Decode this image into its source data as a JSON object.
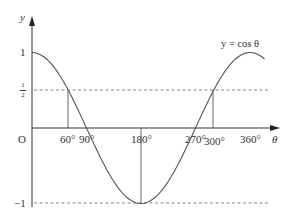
{
  "chart_data": {
    "type": "line",
    "title": "",
    "xlabel": "θ",
    "ylabel": "y",
    "curve_label": "y = cos θ",
    "function": "cos",
    "x_range_deg": [
      0,
      385
    ],
    "ylim": [
      -1,
      1
    ],
    "x_ticks": [
      {
        "value": 60,
        "label": "60°"
      },
      {
        "value": 90,
        "label": "90°"
      },
      {
        "value": 180,
        "label": "180°"
      },
      {
        "value": 270,
        "label": "270°"
      },
      {
        "value": 300,
        "label": "300°"
      },
      {
        "value": 360,
        "label": "360°"
      }
    ],
    "y_ticks": [
      {
        "value": 1,
        "label": "1"
      },
      {
        "value": 0.5,
        "label": "½"
      },
      {
        "value": -1,
        "label": "−1"
      }
    ],
    "origin_label": "O",
    "dashed_lines": [
      {
        "y": 0.5,
        "label": "y = 1/2"
      },
      {
        "y": -1,
        "label": "y = −1"
      }
    ],
    "vertical_markers": [
      {
        "x": 60,
        "from_y": 0,
        "to_y": 0.5
      },
      {
        "x": 180,
        "from_y": 0,
        "to_y": -1
      },
      {
        "x": 300,
        "from_y": 0,
        "to_y": 0.5
      }
    ],
    "points": [
      {
        "x": 0,
        "y": 1
      },
      {
        "x": 60,
        "y": 0.5
      },
      {
        "x": 90,
        "y": 0
      },
      {
        "x": 180,
        "y": -1
      },
      {
        "x": 270,
        "y": 0
      },
      {
        "x": 300,
        "y": 0.5
      },
      {
        "x": 360,
        "y": 1
      }
    ],
    "grid": false,
    "legend": "none",
    "colors": {
      "curve": "#555555",
      "axes": "#333333",
      "dashed": "#777777"
    }
  },
  "labels": {
    "y_axis": "y",
    "x_axis": "θ",
    "origin": "O",
    "curve": "y = cos θ",
    "y_one": "1",
    "y_half_num": "1",
    "y_half_den": "2",
    "y_neg_one": "−1",
    "x60": "60°",
    "x90": "90°",
    "x180": "180°",
    "x270": "270°",
    "x300": "300°",
    "x360": "360°"
  }
}
